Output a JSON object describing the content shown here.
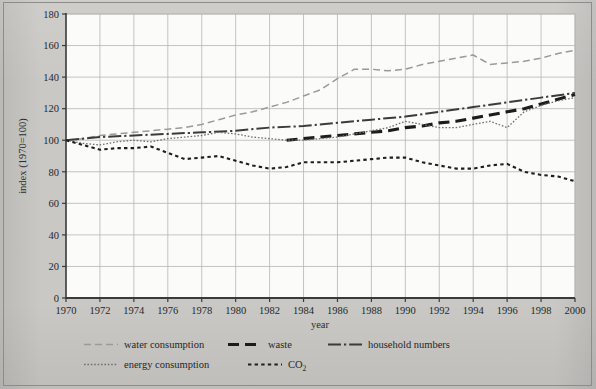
{
  "figure": {
    "background_color": "#c9c8c5",
    "plot_background_color": "#fbfbfa",
    "grid_color": "#b6b5b2",
    "axis_color": "#3a3a3a"
  },
  "chart_data": {
    "type": "line",
    "title": "",
    "xlabel": "year",
    "ylabel": "index (1970=100)",
    "xlim": [
      1970,
      2000
    ],
    "ylim": [
      0,
      180
    ],
    "ytick_step": 20,
    "xtick_step": 2,
    "grid": true,
    "legend_position": "below",
    "x_tick_labels": [
      "1970",
      "1972",
      "1974",
      "1976",
      "1978",
      "1980",
      "1982",
      "1984",
      "1986",
      "1988",
      "1990",
      "1992",
      "1994",
      "1996",
      "1998",
      "2000"
    ],
    "y_tick_labels": [
      "0",
      "20",
      "40",
      "60",
      "80",
      "100",
      "120",
      "140",
      "160",
      "180"
    ],
    "series": [
      {
        "name": "water consumption",
        "style": "dashed-light",
        "color": "#9a9a98",
        "x": [
          1970,
          1971,
          1972,
          1973,
          1974,
          1975,
          1976,
          1977,
          1978,
          1979,
          1980,
          1981,
          1982,
          1983,
          1984,
          1985,
          1986,
          1987,
          1988,
          1989,
          1990,
          1991,
          1992,
          1993,
          1994,
          1995,
          1996,
          1997,
          1998,
          1999,
          2000
        ],
        "values": [
          100,
          101,
          103,
          104,
          105,
          106,
          107,
          108,
          110,
          113,
          116,
          118,
          121,
          124,
          128,
          132,
          139,
          145,
          145,
          144,
          145,
          148,
          150,
          152,
          154,
          148,
          149,
          150,
          152,
          155,
          157
        ]
      },
      {
        "name": "waste",
        "style": "dashed-thick",
        "color": "#1c1c1c",
        "x": [
          1983,
          1984,
          1985,
          1986,
          1987,
          1988,
          1989,
          1990,
          1991,
          1992,
          1993,
          1994,
          1995,
          1996,
          1997,
          1998,
          1999,
          2000
        ],
        "values": [
          100,
          101,
          102,
          103,
          104,
          105,
          106,
          108,
          109,
          111,
          112,
          114,
          116,
          118,
          120,
          123,
          126,
          129
        ]
      },
      {
        "name": "household numbers",
        "style": "dash-dot",
        "color": "#3b3b3b",
        "x": [
          1970,
          1972,
          1974,
          1976,
          1978,
          1980,
          1982,
          1984,
          1986,
          1988,
          1990,
          1992,
          1994,
          1996,
          1998,
          2000
        ],
        "values": [
          100,
          102,
          103,
          104,
          105,
          106,
          108,
          109,
          111,
          113,
          115,
          118,
          121,
          124,
          127,
          130
        ]
      },
      {
        "name": "energy consumption",
        "style": "dotted-fine",
        "color": "#707070",
        "x": [
          1970,
          1971,
          1972,
          1973,
          1974,
          1975,
          1976,
          1977,
          1978,
          1979,
          1980,
          1981,
          1982,
          1983,
          1984,
          1985,
          1986,
          1987,
          1988,
          1989,
          1990,
          1991,
          1992,
          1993,
          1994,
          1995,
          1996,
          1997,
          1998,
          1999,
          2000
        ],
        "values": [
          100,
          98,
          97,
          99,
          100,
          99,
          101,
          102,
          103,
          105,
          104,
          102,
          101,
          100,
          100,
          101,
          102,
          104,
          106,
          108,
          112,
          110,
          108,
          108,
          110,
          112,
          108,
          118,
          122,
          125,
          127
        ]
      },
      {
        "name": "CO2",
        "style": "dash-dot-small",
        "color": "#1f1f1f",
        "x": [
          1970,
          1971,
          1972,
          1973,
          1974,
          1975,
          1976,
          1977,
          1978,
          1979,
          1980,
          1981,
          1982,
          1983,
          1984,
          1985,
          1986,
          1987,
          1988,
          1989,
          1990,
          1991,
          1992,
          1993,
          1994,
          1995,
          1996,
          1997,
          1998,
          1999,
          2000
        ],
        "values": [
          100,
          97,
          94,
          95,
          95,
          96,
          92,
          88,
          89,
          90,
          87,
          84,
          82,
          83,
          86,
          86,
          86,
          87,
          88,
          89,
          89,
          86,
          84,
          82,
          82,
          84,
          85,
          80,
          78,
          77,
          74
        ]
      }
    ]
  },
  "legend": {
    "rows": [
      [
        {
          "label": "water consumption",
          "series": "water consumption"
        },
        {
          "label": "waste",
          "series": "waste"
        },
        {
          "label": "household numbers",
          "series": "household numbers"
        }
      ],
      [
        {
          "label": "energy consumption",
          "series": "energy consumption"
        },
        {
          "label": "CO",
          "subscript": "2",
          "series": "CO2"
        }
      ]
    ]
  }
}
